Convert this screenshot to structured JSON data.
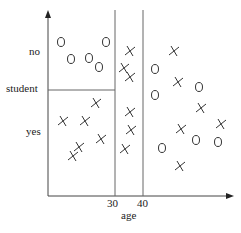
{
  "diagram": {
    "title": "",
    "x_axis": {
      "label": "age",
      "ticks": [
        {
          "label": "30",
          "x": 115
        },
        {
          "label": "40",
          "x": 143
        }
      ]
    },
    "y_axis": {
      "label": "student",
      "categories": [
        "no",
        "yes"
      ]
    },
    "split_lines": {
      "vertical": [
        {
          "x": 115,
          "at": "age = 30"
        },
        {
          "x": 143,
          "at": "age = 40"
        }
      ],
      "horizontal": [
        {
          "y": 90,
          "at": "student",
          "from_x": 48,
          "to_x": 115
        }
      ]
    },
    "legend": {
      "o": "class O",
      "x": "class X"
    },
    "points": [
      {
        "m": "o",
        "x": 61,
        "y": 42
      },
      {
        "m": "o",
        "x": 106,
        "y": 42
      },
      {
        "m": "o",
        "x": 71,
        "y": 59
      },
      {
        "m": "o",
        "x": 89,
        "y": 58
      },
      {
        "m": "o",
        "x": 99,
        "y": 67
      },
      {
        "m": "x",
        "x": 96,
        "y": 103
      },
      {
        "m": "x",
        "x": 63,
        "y": 121
      },
      {
        "m": "x",
        "x": 85,
        "y": 121
      },
      {
        "m": "x",
        "x": 101,
        "y": 139
      },
      {
        "m": "x",
        "x": 79,
        "y": 147
      },
      {
        "m": "x",
        "x": 73,
        "y": 156
      },
      {
        "m": "x",
        "x": 130,
        "y": 51
      },
      {
        "m": "x",
        "x": 124,
        "y": 68
      },
      {
        "m": "x",
        "x": 130,
        "y": 77
      },
      {
        "m": "x",
        "x": 130,
        "y": 112
      },
      {
        "m": "x",
        "x": 131,
        "y": 130
      },
      {
        "m": "x",
        "x": 125,
        "y": 149
      },
      {
        "m": "x",
        "x": 174,
        "y": 51
      },
      {
        "m": "o",
        "x": 155,
        "y": 69
      },
      {
        "m": "x",
        "x": 178,
        "y": 82
      },
      {
        "m": "o",
        "x": 199,
        "y": 87
      },
      {
        "m": "o",
        "x": 155,
        "y": 95
      },
      {
        "m": "x",
        "x": 201,
        "y": 108
      },
      {
        "m": "x",
        "x": 181,
        "y": 129
      },
      {
        "m": "x",
        "x": 221,
        "y": 124
      },
      {
        "m": "o",
        "x": 196,
        "y": 140
      },
      {
        "m": "o",
        "x": 218,
        "y": 142
      },
      {
        "m": "o",
        "x": 162,
        "y": 148
      },
      {
        "m": "x",
        "x": 180,
        "y": 166
      }
    ]
  },
  "labels": {
    "no": "no",
    "student": "student",
    "yes": "yes",
    "tick30": "30",
    "tick40": "40",
    "age": "age"
  }
}
